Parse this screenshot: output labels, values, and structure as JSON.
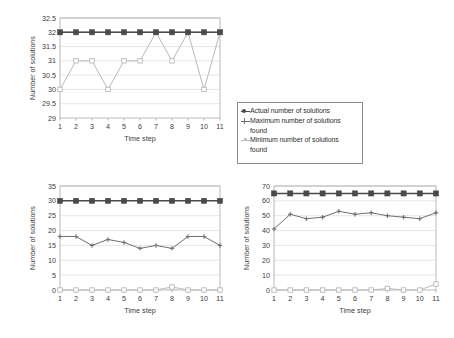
{
  "figure": {
    "background": "#ffffff",
    "panels": [
      "top",
      "bottom-left",
      "bottom-right"
    ]
  },
  "legend": {
    "entries": [
      {
        "label": "Actual number of solutions",
        "label2": "",
        "marker": "dark-square-line",
        "color": "#4a4a4a"
      },
      {
        "label": "Maximum number of solutions",
        "label2": "found",
        "marker": "cross-line",
        "color": "#6f6f6f"
      },
      {
        "label": "Minimum number of solutions",
        "label2": "found",
        "marker": "light-line",
        "color": "#b9b9b9"
      }
    ]
  },
  "chart_data": [
    {
      "id": "top",
      "type": "line",
      "title": "",
      "xlabel": "Time step",
      "ylabel": "Number of solutions",
      "x": [
        1,
        2,
        3,
        4,
        5,
        6,
        7,
        8,
        9,
        10,
        11
      ],
      "xticklabels": [
        "1",
        "2",
        "3",
        "4",
        "5",
        "6",
        "7",
        "8",
        "9",
        "10",
        "11"
      ],
      "yticklabels": [
        "29",
        "29.5",
        "30",
        "30.5",
        "31",
        "31.5",
        "32",
        "32.5"
      ],
      "yticks": [
        29,
        29.5,
        30,
        30.5,
        31,
        31.5,
        32,
        32.5
      ],
      "ylim": [
        29,
        32.5
      ],
      "grid": true,
      "legend": "external",
      "series": [
        {
          "name": "Actual number of solutions",
          "color": "#4a4a4a",
          "marker": "square",
          "values": [
            32,
            32,
            32,
            32,
            32,
            32,
            32,
            32,
            32,
            32,
            32
          ]
        },
        {
          "name": "Maximum number of solutions found",
          "color": "#6f6f6f",
          "marker": "cross",
          "values": [
            32,
            32,
            32,
            32,
            32,
            32,
            32,
            32,
            32,
            32,
            32
          ]
        },
        {
          "name": "Minimum number of solutions found",
          "color": "#b9b9b9",
          "marker": "square-open",
          "values": [
            30,
            31,
            31,
            30,
            31,
            31,
            32,
            31,
            32,
            30,
            32
          ]
        }
      ]
    },
    {
      "id": "bottom-left",
      "type": "line",
      "title": "",
      "xlabel": "Time step",
      "ylabel": "Number of solutions",
      "x": [
        1,
        2,
        3,
        4,
        5,
        6,
        7,
        8,
        9,
        10,
        11
      ],
      "xticklabels": [
        "1",
        "2",
        "3",
        "4",
        "5",
        "6",
        "7",
        "8",
        "9",
        "10",
        "11"
      ],
      "yticklabels": [
        "0",
        "5",
        "10",
        "15",
        "20",
        "25",
        "30",
        "35"
      ],
      "yticks": [
        0,
        5,
        10,
        15,
        20,
        25,
        30,
        35
      ],
      "ylim": [
        0,
        35
      ],
      "grid": true,
      "legend": "external",
      "series": [
        {
          "name": "Actual number of solutions",
          "color": "#4a4a4a",
          "marker": "square",
          "values": [
            30,
            30,
            30,
            30,
            30,
            30,
            30,
            30,
            30,
            30,
            30
          ]
        },
        {
          "name": "Maximum number of solutions found",
          "color": "#6f6f6f",
          "marker": "cross",
          "values": [
            18,
            18,
            15,
            17,
            16,
            14,
            15,
            14,
            18,
            18,
            15
          ]
        },
        {
          "name": "Minimum number of solutions found",
          "color": "#b9b9b9",
          "marker": "square-open",
          "values": [
            0,
            0,
            0,
            0,
            0,
            0,
            0,
            1,
            0,
            0,
            0
          ]
        }
      ]
    },
    {
      "id": "bottom-right",
      "type": "line",
      "title": "",
      "xlabel": "Time step",
      "ylabel": "Number of solutions",
      "x": [
        1,
        2,
        3,
        4,
        5,
        6,
        7,
        8,
        9,
        10,
        11
      ],
      "xticklabels": [
        "1",
        "2",
        "3",
        "4",
        "5",
        "6",
        "7",
        "8",
        "9",
        "10",
        "11"
      ],
      "yticklabels": [
        "0",
        "10",
        "20",
        "30",
        "40",
        "50",
        "60",
        "70"
      ],
      "yticks": [
        0,
        10,
        20,
        30,
        40,
        50,
        60,
        70
      ],
      "ylim": [
        0,
        70
      ],
      "grid": true,
      "legend": "external",
      "series": [
        {
          "name": "Actual number of solutions",
          "color": "#4a4a4a",
          "marker": "square",
          "values": [
            65,
            65,
            65,
            65,
            65,
            65,
            65,
            65,
            65,
            65,
            65
          ]
        },
        {
          "name": "Maximum number of solutions found",
          "color": "#6f6f6f",
          "marker": "cross",
          "values": [
            41,
            51,
            48,
            49,
            53,
            51,
            52,
            50,
            49,
            48,
            52
          ]
        },
        {
          "name": "Minimum number of solutions found",
          "color": "#b9b9b9",
          "marker": "square-open",
          "values": [
            0,
            0,
            0,
            0,
            0,
            0,
            0,
            1,
            0,
            0,
            4
          ]
        }
      ]
    }
  ]
}
